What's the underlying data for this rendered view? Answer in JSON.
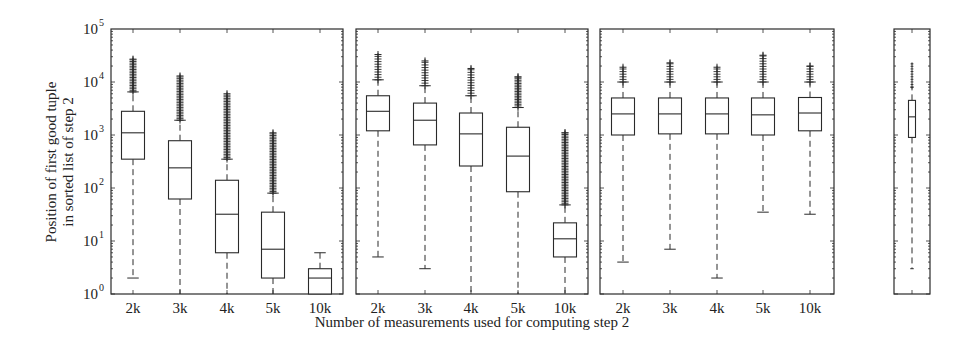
{
  "chart_data": {
    "type": "boxplot",
    "title": "",
    "ylabel_line1": "Position of first good tuple",
    "ylabel_line2": "in sorted list of step 2",
    "xlabel": "Number of measurements used for computing step 2",
    "yscale": "log",
    "ylim": [
      1,
      100000
    ],
    "ytick_labels": [
      "10",
      "10",
      "10",
      "10",
      "10",
      "10"
    ],
    "ytick_exponents": [
      "0",
      "1",
      "2",
      "3",
      "4",
      "5"
    ],
    "grid": false,
    "legend": null,
    "panels": [
      {
        "name": "panel-1",
        "categories": [
          "2k",
          "3k",
          "4k",
          "5k",
          "10k"
        ],
        "boxes": [
          {
            "q1": 350,
            "median": 1100,
            "q3": 2800,
            "whisker_low": 2,
            "whisker_high": 6500,
            "outliers_min": 6500,
            "outliers_max": 27000
          },
          {
            "q1": 62,
            "median": 240,
            "q3": 780,
            "whisker_low": 1,
            "whisker_high": 1900,
            "outliers_min": 1900,
            "outliers_max": 13000
          },
          {
            "q1": 6,
            "median": 32,
            "q3": 140,
            "whisker_low": 1,
            "whisker_high": 350,
            "outliers_min": 350,
            "outliers_max": 6000
          },
          {
            "q1": 2,
            "median": 7,
            "q3": 35,
            "whisker_low": 1,
            "whisker_high": 80,
            "outliers_min": 80,
            "outliers_max": 1100
          },
          {
            "q1": 1,
            "median": 2,
            "q3": 3,
            "whisker_low": 1,
            "whisker_high": 6,
            "outliers_min": null,
            "outliers_max": null
          }
        ]
      },
      {
        "name": "panel-2",
        "categories": [
          "2k",
          "3k",
          "4k",
          "5k",
          "10k"
        ],
        "boxes": [
          {
            "q1": 1200,
            "median": 2800,
            "q3": 5500,
            "whisker_low": 5,
            "whisker_high": 11000,
            "outliers_min": 11000,
            "outliers_max": 33000
          },
          {
            "q1": 650,
            "median": 1900,
            "q3": 4000,
            "whisker_low": 3,
            "whisker_high": 8500,
            "outliers_min": 8500,
            "outliers_max": 25000
          },
          {
            "q1": 260,
            "median": 1050,
            "q3": 2600,
            "whisker_low": 1,
            "whisker_high": 5500,
            "outliers_min": 5500,
            "outliers_max": 18000
          },
          {
            "q1": 85,
            "median": 400,
            "q3": 1400,
            "whisker_low": 1,
            "whisker_high": 3300,
            "outliers_min": 3300,
            "outliers_max": 12500
          },
          {
            "q1": 5,
            "median": 11,
            "q3": 22,
            "whisker_low": 1,
            "whisker_high": 48,
            "outliers_min": 48,
            "outliers_max": 1100
          }
        ]
      },
      {
        "name": "panel-3",
        "categories": [
          "2k",
          "3k",
          "4k",
          "5k",
          "10k"
        ],
        "boxes": [
          {
            "q1": 1000,
            "median": 2500,
            "q3": 5000,
            "whisker_low": 4,
            "whisker_high": 10000,
            "outliers_min": 10000,
            "outliers_max": 19000
          },
          {
            "q1": 1050,
            "median": 2500,
            "q3": 5000,
            "whisker_low": 7,
            "whisker_high": 10000,
            "outliers_min": 10000,
            "outliers_max": 23000
          },
          {
            "q1": 1050,
            "median": 2500,
            "q3": 5000,
            "whisker_low": 2,
            "whisker_high": 10000,
            "outliers_min": 10000,
            "outliers_max": 19000
          },
          {
            "q1": 1000,
            "median": 2400,
            "q3": 5000,
            "whisker_low": 35,
            "whisker_high": 10000,
            "outliers_min": 10000,
            "outliers_max": 32000
          },
          {
            "q1": 1200,
            "median": 2600,
            "q3": 5100,
            "whisker_low": 32,
            "whisker_high": 10000,
            "outliers_min": 10000,
            "outliers_max": 20000
          }
        ]
      },
      {
        "name": "panel-4",
        "categories": [
          ""
        ],
        "boxes": [
          {
            "q1": 900,
            "median": 2200,
            "q3": 4500,
            "whisker_low": 3,
            "whisker_high": 8000,
            "outliers_min": 8000,
            "outliers_max": 22000
          }
        ]
      }
    ]
  }
}
